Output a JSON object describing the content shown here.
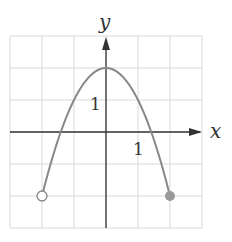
{
  "chart_data": {
    "type": "line",
    "title": "",
    "function": "f(x) = 2 - x^2",
    "xlabel": "x",
    "ylabel": "y",
    "xlim": [
      -3,
      3
    ],
    "ylim": [
      -3,
      3
    ],
    "grid": true,
    "grid_step": 1,
    "tick_labels": {
      "x": [
        "1"
      ],
      "y": [
        "1"
      ]
    },
    "series": [
      {
        "name": "parabola",
        "x": [
          -2,
          -1.5,
          -1,
          -0.5,
          0,
          0.5,
          1,
          1.5,
          2
        ],
        "y": [
          -2,
          -0.25,
          1,
          1.75,
          2,
          1.75,
          1,
          -0.25,
          -2
        ]
      }
    ],
    "endpoints": [
      {
        "x": -2,
        "y": -2,
        "style": "open"
      },
      {
        "x": 2,
        "y": -2,
        "style": "closed"
      }
    ],
    "vertex": {
      "x": 0,
      "y": 2
    }
  },
  "labels": {
    "x_axis": "x",
    "y_axis": "y",
    "x_tick": "1",
    "y_tick": "1"
  },
  "colors": {
    "grid": "#d9d9d9",
    "axis": "#333333",
    "curve": "#888888",
    "closed_point": "#999999"
  }
}
